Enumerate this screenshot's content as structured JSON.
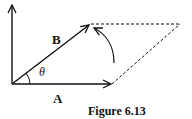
{
  "figure": {
    "caption": "Figure 6.13",
    "vector_a_label": "A",
    "vector_b_label": "B",
    "angle_label": "θ",
    "colors": {
      "stroke": "#111111",
      "background": "#ffffff"
    },
    "geometry": {
      "origin": [
        12,
        84
      ],
      "a_tip": [
        112,
        84
      ],
      "b_tip": [
        90,
        24
      ],
      "vertical_axis_top": [
        12,
        4
      ],
      "parallelogram_far_corner": [
        180,
        24
      ]
    }
  }
}
